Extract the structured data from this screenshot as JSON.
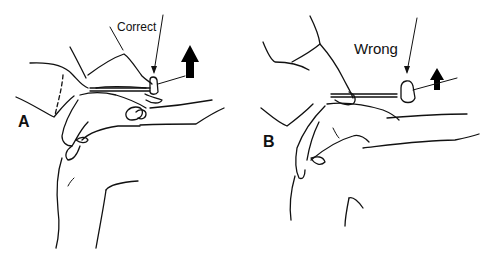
{
  "figure": {
    "panels": [
      {
        "id": "A",
        "letter": "A",
        "caption": "Correct",
        "description": "Examiner's hand holds reflex hammer resting on patient's hand over the wrist; hammer head strikes correctly with upward arrow"
      },
      {
        "id": "B",
        "letter": "B",
        "caption": "Wrong",
        "description": "Examiner's hand holds reflex hammer too far from target; hammer head misplaced, upward arrow"
      }
    ],
    "colors": {
      "line": "#111111",
      "background": "#ffffff",
      "arrow_fill": "#000000"
    }
  }
}
